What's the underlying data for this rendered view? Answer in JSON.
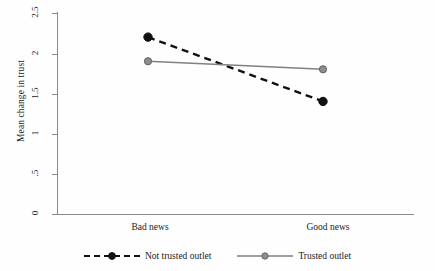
{
  "chart_data": {
    "type": "line",
    "title": "",
    "xlabel": "",
    "ylabel": "Mean change in trust",
    "categories": [
      "Bad news",
      "Good news"
    ],
    "ylim": [
      0,
      2.5
    ],
    "yticks": [
      0,
      0.5,
      1,
      1.5,
      2,
      2.5
    ],
    "ytick_labels": [
      "0",
      ".5",
      "1",
      "1.5",
      "2",
      "2.5"
    ],
    "grid": false,
    "legend_position": "bottom",
    "series": [
      {
        "name": "Not trusted outlet",
        "values": [
          2.2,
          1.4
        ],
        "color": "#111111",
        "linestyle": "dashed",
        "marker": "circle"
      },
      {
        "name": "Trusted outlet",
        "values": [
          1.9,
          1.8
        ],
        "color": "#808080",
        "linestyle": "solid",
        "marker": "circle"
      }
    ]
  },
  "axis": {
    "y_title": "Mean change in trust",
    "tick_labels": {
      "t0": "0",
      "t1": ".5",
      "t2": "1",
      "t3": "1.5",
      "t4": "2",
      "t5": "2.5"
    },
    "x_labels": {
      "left": "Bad news",
      "right": "Good news"
    }
  },
  "legend": {
    "items": [
      {
        "label": "Not trusted outlet",
        "style": "dashed-black-dot"
      },
      {
        "label": "Trusted outlet",
        "style": "solid-gray-dot"
      }
    ]
  },
  "colors": {
    "axis": "#8a8a8a",
    "series_not_trusted": "#111111",
    "series_trusted": "#808080",
    "background": "#fefefe",
    "text": "#222222"
  }
}
